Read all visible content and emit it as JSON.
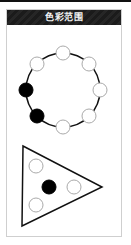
{
  "header": {
    "title": "色彩范围"
  },
  "colors": {
    "header_bg": "#1b1b1b",
    "header_text": "#f2f2f2",
    "frame_border": "#cfcfcf",
    "stroke": "#111111",
    "node_fill_empty": "#ffffff",
    "node_fill_filled": "#000000",
    "node_stroke_empty": "#aaaaaa"
  },
  "ring_diagram": {
    "center": [
      63,
      90
    ],
    "radius": 37,
    "node_radius": 7,
    "nodes": [
      {
        "position": "top",
        "x": 63,
        "y": 53,
        "filled": false
      },
      {
        "position": "upper-right",
        "x": 89,
        "y": 64,
        "filled": false
      },
      {
        "position": "right",
        "x": 100,
        "y": 90,
        "filled": false
      },
      {
        "position": "lower-right",
        "x": 89,
        "y": 116,
        "filled": false
      },
      {
        "position": "bottom",
        "x": 63,
        "y": 127,
        "filled": false
      },
      {
        "position": "lower-left",
        "x": 37,
        "y": 116,
        "filled": true
      },
      {
        "position": "left",
        "x": 26,
        "y": 90,
        "filled": true
      },
      {
        "position": "upper-left",
        "x": 37,
        "y": 64,
        "filled": false
      }
    ]
  },
  "triangle_diagram": {
    "vertices": [
      [
        23,
        146
      ],
      [
        102,
        187
      ],
      [
        22,
        226
      ]
    ],
    "node_radius": 7,
    "nodes": [
      {
        "position": "top-left",
        "x": 36,
        "y": 166,
        "filled": false
      },
      {
        "position": "center",
        "x": 49,
        "y": 187,
        "filled": true
      },
      {
        "position": "right",
        "x": 74,
        "y": 187,
        "filled": false
      },
      {
        "position": "bottom-left",
        "x": 36,
        "y": 205,
        "filled": false
      }
    ]
  }
}
